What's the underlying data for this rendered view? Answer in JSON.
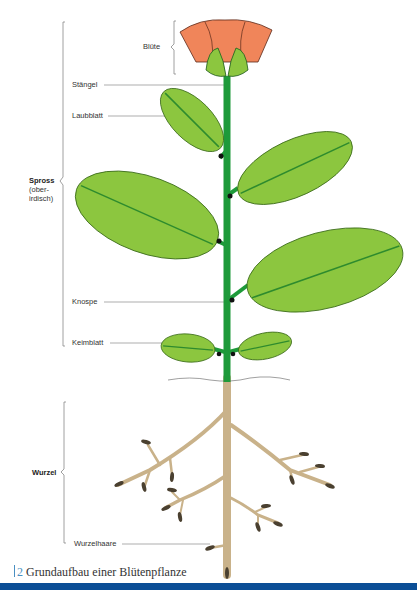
{
  "figure": {
    "title": "Grundaufbau einer Blütenpflanze",
    "number": "2"
  },
  "labels": {
    "bluete": "Blüte",
    "staengel": "Stängel",
    "laubblatt": "Laubblatt",
    "spross": "Spross",
    "spross_sub": "(ober-irdisch)",
    "spross_sub_line1": "(ober-",
    "spross_sub_line2": "irdisch)",
    "knospe": "Knospe",
    "keimblatt": "Keimblatt",
    "wurzel": "Wurzel",
    "wurzelhaare": "Wurzelhaare"
  },
  "colors": {
    "petal": "#f0855a",
    "petal_outline": "#5a2a1a",
    "sepal": "#8cc63f",
    "leaf": "#8cc63f",
    "leaf_vein": "#2e8b2e",
    "stem": "#1e9a3a",
    "root": "#c9b28a",
    "bottom_bar": "#0b4e96",
    "caption_accent": "#4a8fc2"
  }
}
